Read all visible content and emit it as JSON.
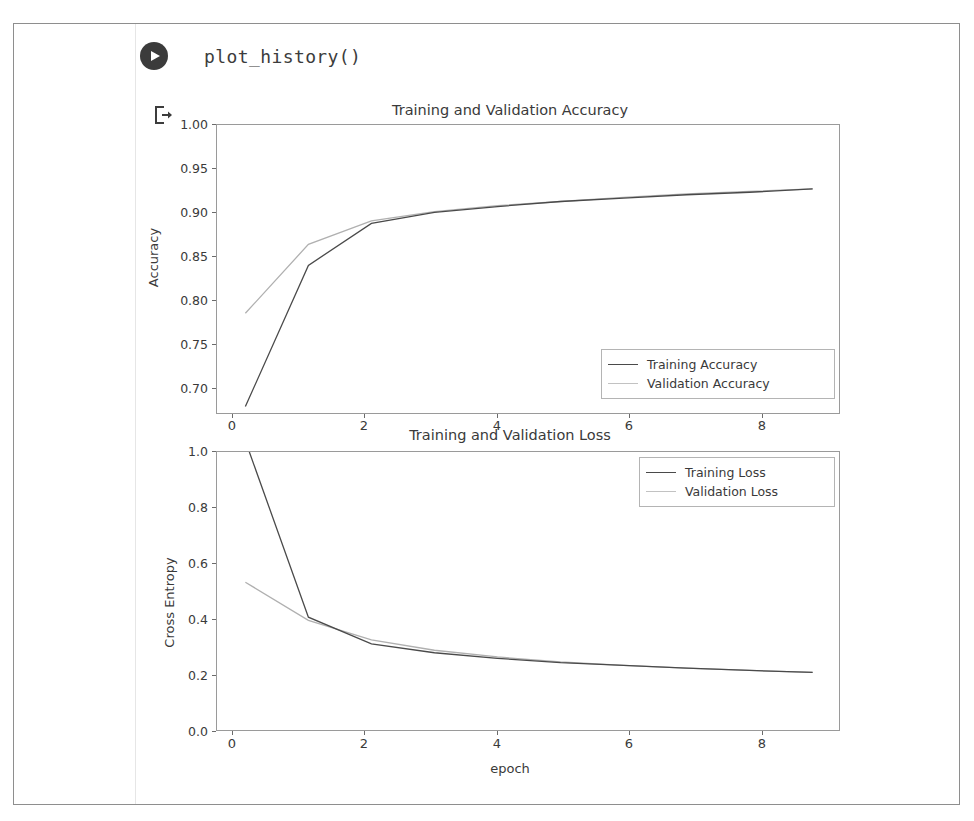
{
  "notebook": {
    "run_button_icon": "play-circle-icon",
    "code_text": "plot_history()",
    "output_icon": "output-arrow-icon"
  },
  "colors": {
    "train_line": "#4a4a4a",
    "val_line": "#b0b0b0",
    "axis": "#9a9a9a",
    "text": "#3a3a3a",
    "frame": "#8e8e8e",
    "run_button_bg": "#3b3b3b"
  },
  "chart_data": [
    {
      "type": "line",
      "title": "Training and Validation Accuracy",
      "xlabel": "",
      "ylabel": "Accuracy",
      "x": [
        0,
        1,
        2,
        3,
        4,
        5,
        6,
        7,
        8,
        9
      ],
      "xlim": [
        -0.45,
        9.45
      ],
      "ylim": [
        0.655,
        1.0
      ],
      "xticks": [
        0,
        2,
        4,
        6,
        8
      ],
      "xtick_labels": [
        "0",
        "2",
        "4",
        "6",
        "8"
      ],
      "yticks": [
        0.7,
        0.75,
        0.8,
        0.85,
        0.9,
        0.95,
        1.0
      ],
      "ytick_labels": [
        "0.70",
        "0.75",
        "0.80",
        "0.85",
        "0.90",
        "0.95",
        "1.00"
      ],
      "grid": false,
      "legend_position": "lower right",
      "series": [
        {
          "name": "Training Accuracy",
          "color": "#4a4a4a",
          "style": "solid",
          "values": [
            0.665,
            0.833,
            0.883,
            0.896,
            0.903,
            0.909,
            0.913,
            0.917,
            0.92,
            0.924
          ]
        },
        {
          "name": "Validation Accuracy",
          "color": "#b0b0b0",
          "style": "solid",
          "values": [
            0.776,
            0.858,
            0.886,
            0.897,
            0.904,
            0.909,
            0.914,
            0.918,
            0.921,
            0.924
          ]
        }
      ]
    },
    {
      "type": "line",
      "title": "Training and Validation Loss",
      "xlabel": "epoch",
      "ylabel": "Cross Entropy",
      "x": [
        0,
        1,
        2,
        3,
        4,
        5,
        6,
        7,
        8,
        9
      ],
      "xlim": [
        -0.45,
        9.45
      ],
      "ylim": [
        0.0,
        1.0
      ],
      "xticks": [
        0,
        2,
        4,
        6,
        8
      ],
      "xtick_labels": [
        "0",
        "2",
        "4",
        "6",
        "8"
      ],
      "yticks": [
        0.0,
        0.2,
        0.4,
        0.6,
        0.8,
        1.0
      ],
      "ytick_labels": [
        "0.0",
        "0.2",
        "0.4",
        "0.6",
        "0.8",
        "1.0"
      ],
      "grid": false,
      "legend_position": "upper right",
      "series": [
        {
          "name": "Training Loss",
          "color": "#4a4a4a",
          "style": "solid",
          "values": [
            1.04,
            0.41,
            0.315,
            0.283,
            0.263,
            0.248,
            0.238,
            0.228,
            0.22,
            0.213
          ]
        },
        {
          "name": "Validation Loss",
          "color": "#b0b0b0",
          "style": "solid",
          "values": [
            0.535,
            0.399,
            0.329,
            0.292,
            0.268,
            0.25,
            0.238,
            0.228,
            0.22,
            0.213
          ]
        }
      ]
    }
  ]
}
